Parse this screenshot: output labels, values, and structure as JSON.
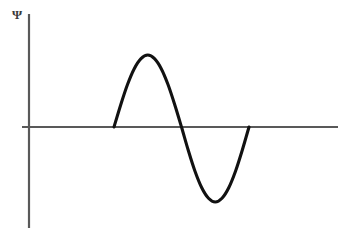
{
  "figure": {
    "background_color": "#ffffff",
    "axis_color": "#595959",
    "curve_color": "#111111",
    "label_color": "#3a3a3a",
    "y_axis_label": "Ψ",
    "y_axis_label_name": "psi-symbol",
    "x_axis_label": "",
    "title": ""
  },
  "chart_data": {
    "type": "line",
    "title": "",
    "xlabel": "",
    "ylabel": "Ψ",
    "grid": false,
    "legend": false,
    "xlim": [
      0,
      1
    ],
    "ylim": [
      -1.15,
      1.15
    ],
    "axes": {
      "x_axis_y_value": 0,
      "x_axis_start_px": 22,
      "x_axis_end_px": 338,
      "y_axis_x_px": 29,
      "y_axis_top_px": 14,
      "y_axis_bottom_px": 228,
      "baseline_y_px": 127
    },
    "series": [
      {
        "name": "Ψ",
        "description": "one full sine period",
        "periods": 1,
        "amplitude": 1,
        "start_px": 114,
        "end_px": 249,
        "peak_px": {
          "x": 148,
          "y": 55
        },
        "trough_px": {
          "x": 215,
          "y": 202
        },
        "zero_crossings_px": [
          114,
          181,
          249
        ],
        "x": [
          0.0,
          0.05,
          0.1,
          0.15,
          0.2,
          0.25,
          0.3,
          0.35,
          0.4,
          0.45,
          0.5,
          0.55,
          0.6,
          0.65,
          0.7,
          0.75,
          0.8,
          0.85,
          0.9,
          0.95,
          1.0
        ],
        "values": [
          0.0,
          0.31,
          0.59,
          0.81,
          0.95,
          1.0,
          0.95,
          0.81,
          0.59,
          0.31,
          0.0,
          -0.31,
          -0.59,
          -0.81,
          -0.95,
          -1.0,
          -0.95,
          -0.81,
          -0.59,
          -0.31,
          0.0
        ]
      }
    ]
  }
}
